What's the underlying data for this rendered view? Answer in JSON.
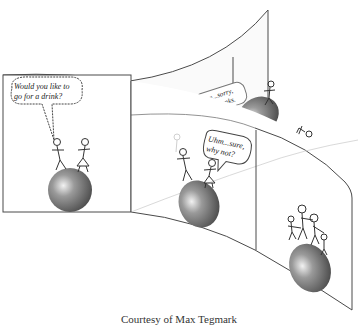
{
  "figure": {
    "panels": [
      {
        "id": "panel-1",
        "position": "left flat panel",
        "bubble_text_line1": "Would you like to",
        "bubble_text_line2": "go for a drink?",
        "figures": 2,
        "globe": true
      },
      {
        "id": "panel-2a",
        "position": "upper branch middle (faded)",
        "bubble_text_line1": "Uhm...sorry,",
        "bubble_text_line2": "no thanks.",
        "figures": 2,
        "globe": true
      },
      {
        "id": "panel-2b",
        "position": "lower branch middle",
        "bubble_text_line1": "Uhm...sure,",
        "bubble_text_line2": "why not?",
        "figures": 2,
        "globe": true
      },
      {
        "id": "panel-3a",
        "position": "upper branch right",
        "figures": 2,
        "globe": true,
        "note": "figures far apart on globe"
      },
      {
        "id": "panel-3b",
        "position": "lower branch right",
        "figures": 4,
        "globe": true,
        "note": "family of four holding hands on globe"
      }
    ]
  },
  "caption": "Courtesy of Max Tegmark",
  "colors": {
    "line": "#4a4a4a",
    "globe_dark": "#555555",
    "globe_light": "#e8e8e8",
    "background": "#ffffff",
    "faded": "#bbbbbb"
  }
}
